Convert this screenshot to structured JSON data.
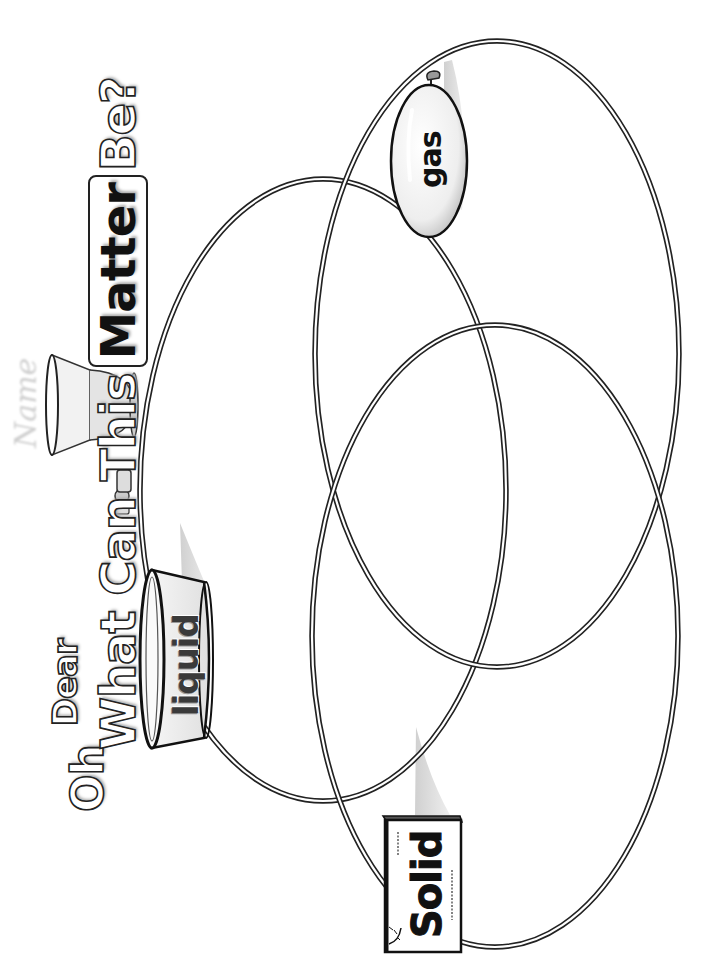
{
  "title": {
    "line1_oh": "Oh",
    "line1_dear": "Dear",
    "line2_prefix": "What Can This",
    "line2_highlight": "Matter",
    "line2_suffix": "Be?"
  },
  "ghost_label": "Name",
  "venn": {
    "circles": [
      {
        "id": "liquid",
        "label": "liquid",
        "cx": 323,
        "cy": 490,
        "rx": 183,
        "ry": 311
      },
      {
        "id": "gas",
        "label": "gas",
        "cx": 497,
        "cy": 354,
        "rx": 182,
        "ry": 313
      },
      {
        "id": "solid",
        "label": "Solid",
        "cx": 495,
        "cy": 636,
        "rx": 183,
        "ry": 311
      }
    ],
    "stroke_color": "#222222",
    "background": "#ffffff"
  },
  "labels": {
    "gas": "gas",
    "liquid": "liquid",
    "solid": "Solid"
  },
  "icons": {
    "gas": "balloon-icon",
    "liquid": "bowl-icon",
    "solid": "box-icon",
    "title_decor": [
      "beaker-icon",
      "spoon-icon",
      "flask-icon"
    ]
  }
}
